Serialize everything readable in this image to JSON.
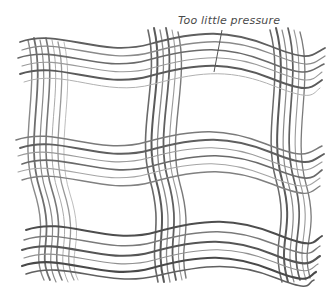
{
  "illustration": {
    "subject": "pencil sketch of wavy crosshatched grid strokes",
    "annotation": {
      "text": "Too little pressure"
    },
    "stroke_color": "#5a5a5a",
    "light_stroke_color": "#9a9a9a",
    "background": "#ffffff",
    "horizontal_bands": [
      {
        "y": 60
      },
      {
        "y": 162
      },
      {
        "y": 248
      }
    ],
    "vertical_bands": [
      {
        "x": 42
      },
      {
        "x": 162
      },
      {
        "x": 290
      }
    ]
  }
}
